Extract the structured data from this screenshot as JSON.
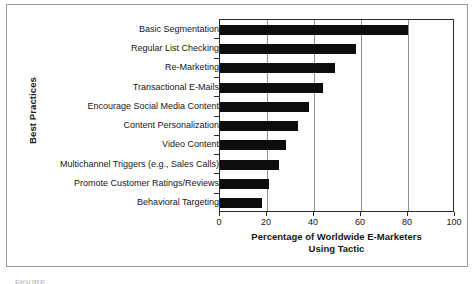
{
  "chart_data": {
    "type": "bar",
    "orientation": "horizontal",
    "title": "",
    "xlabel": "Percentage of Worldwide E-Marketers Using Tactic",
    "xlabel_lines": [
      "Percentage of Worldwide E-Marketers",
      "Using Tactic"
    ],
    "ylabel": "Best Practices",
    "categories": [
      "Basic Segmentation",
      "Regular List Checking",
      "Re-Marketing",
      "Transactional E-Mails",
      "Encourage Social Media Content",
      "Content Personalization",
      "Video Content",
      "Multichannel Triggers (e.g., Sales Calls)",
      "Promote Customer Ratings/Reviews",
      "Behavioral Targeting"
    ],
    "values": [
      80,
      58,
      49,
      44,
      38,
      33,
      28,
      25,
      21,
      18
    ],
    "xlim": [
      0,
      100
    ],
    "xticks": [
      0,
      20,
      40,
      60,
      80,
      100
    ],
    "xtick_labels": [
      "0",
      "20",
      "40",
      "60",
      "80",
      "100"
    ],
    "grid": "vertical",
    "legend": "none",
    "bar_color": "#0d0d0d",
    "gridline_color": "#8f8f8f",
    "axis_color": "#2a2a2a"
  },
  "figure": {
    "border_color": "#9a9a9a",
    "caption_partial": "FIGURE"
  }
}
